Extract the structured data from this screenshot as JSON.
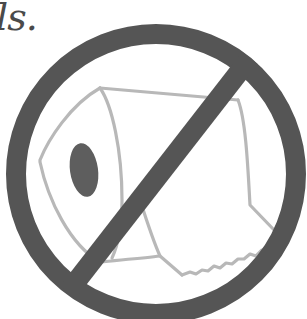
{
  "caption": {
    "text": "ls."
  },
  "illustration": {
    "subject": "toilet-paper-roll",
    "overlay": "prohibition-sign",
    "colors": {
      "ring": "#555555",
      "slash": "#555555",
      "roll_outline": "#b8b8b8",
      "roll_hole": "#5e5e5e",
      "caption": "#4a4a4a",
      "background": "#ffffff"
    }
  }
}
